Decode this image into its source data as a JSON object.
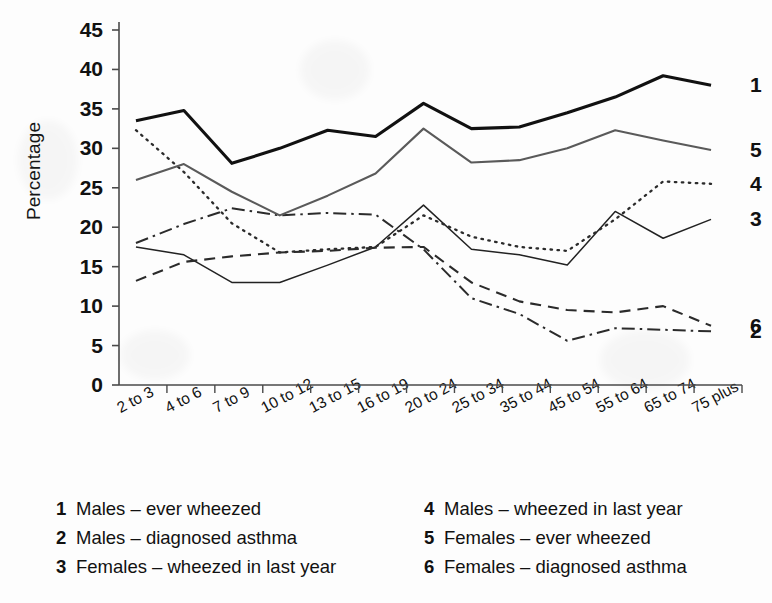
{
  "chart_data": {
    "type": "line",
    "title": "",
    "xlabel": "",
    "ylabel": "Percentage",
    "ylim": [
      0,
      45
    ],
    "ytick_step": 5,
    "yticks": [
      45,
      40,
      35,
      30,
      25,
      20,
      15,
      10,
      5,
      0
    ],
    "grid": false,
    "legend_position": "below",
    "categories": [
      "2 to 3",
      "4 to 6",
      "7 to 9",
      "10 to 12",
      "13 to 15",
      "16 to 19",
      "20 to 24",
      "25 to 34",
      "35 to 44",
      "45 to 54",
      "55 to 64",
      "65 to 74",
      "75 plus"
    ],
    "series": [
      {
        "key": "1",
        "name": "Males – ever wheezed",
        "style": "solid-bold",
        "color": "#111111",
        "end_label": "1",
        "values": [
          33.5,
          34.8,
          28.1,
          30.0,
          32.3,
          31.5,
          35.7,
          32.5,
          32.7,
          34.5,
          36.5,
          39.2,
          38.0
        ]
      },
      {
        "key": "2",
        "name": "Males – diagnosed asthma",
        "style": "dash-dot",
        "color": "#2b2b2b",
        "end_label": "2",
        "values": [
          18.0,
          20.4,
          22.4,
          21.5,
          21.8,
          21.6,
          17.2,
          11.0,
          9.0,
          5.6,
          7.2,
          7.0,
          6.8
        ]
      },
      {
        "key": "3",
        "name": "Females – wheezed in last year",
        "style": "solid-thin",
        "color": "#222222",
        "end_label": "3",
        "values": [
          17.5,
          16.5,
          13.0,
          13.0,
          15.2,
          17.5,
          22.8,
          17.2,
          16.5,
          15.2,
          22.0,
          18.6,
          21.0
        ]
      },
      {
        "key": "4",
        "name": "Males – wheezed in last year",
        "style": "dotted",
        "color": "#2b2b2b",
        "end_label": "4",
        "values": [
          32.3,
          27.0,
          20.5,
          16.8,
          17.2,
          17.5,
          21.5,
          18.8,
          17.5,
          17.0,
          21.0,
          25.8,
          25.5
        ]
      },
      {
        "key": "5",
        "name": "Females – ever wheezed",
        "style": "solid-gray",
        "color": "#5a5a5a",
        "end_label": "5",
        "values": [
          26.0,
          28.0,
          24.5,
          21.5,
          24.0,
          26.8,
          32.5,
          28.2,
          28.5,
          30.0,
          32.3,
          31.0,
          29.8
        ]
      },
      {
        "key": "6",
        "name": "Females – diagnosed asthma",
        "style": "dashed",
        "color": "#2b2b2b",
        "end_label": "6",
        "values": [
          13.2,
          15.6,
          16.3,
          16.8,
          17.0,
          17.4,
          17.5,
          13.0,
          10.6,
          9.5,
          9.2,
          10.0,
          7.5
        ]
      }
    ]
  },
  "legend": {
    "left_column": [
      {
        "key": "1",
        "text": "Males – ever wheezed"
      },
      {
        "key": "2",
        "text": "Males – diagnosed asthma"
      },
      {
        "key": "3",
        "text": "Females – wheezed in last year"
      }
    ],
    "right_column": [
      {
        "key": "4",
        "text": "Males – wheezed in last year"
      },
      {
        "key": "5",
        "text": "Females – ever wheezed"
      },
      {
        "key": "6",
        "text": "Females – diagnosed asthma"
      }
    ]
  }
}
